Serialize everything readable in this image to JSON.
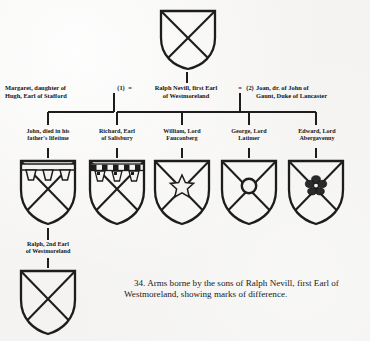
{
  "figure": {
    "number": "34.",
    "caption": "34. Arms borne by the sons of Ralph Nevill, first Earl of Westmoreland, showing marks of difference.",
    "ink_color": "#1a1a1a",
    "paper_color": "#f4f3f1"
  },
  "root": {
    "shield_name": "nevill-saltire-plain",
    "blazon_note": "saltire"
  },
  "marriage": {
    "wife_first": "Margaret, daughter of\nHugh, Earl of Stafford",
    "first_marker": "(1)",
    "equals_left": "=",
    "husband": "Ralph Nevill, first Earl\nof Westmoreland",
    "equals_right": "=",
    "second_marker": "(2)",
    "wife_second": "Joan, dr. of John of\nGaunt, Duke of Lancaster"
  },
  "sons": [
    {
      "label": "John, died in his\nfather's lifetime",
      "shield_name": "saltire-with-plain-label",
      "mark": "label"
    },
    {
      "label": "Richard, Earl\nof Salisbury",
      "shield_name": "saltire-with-compony-label",
      "mark": "label-compony"
    },
    {
      "label": "William, Lord\nFauconberg",
      "shield_name": "saltire-with-mullet",
      "mark": "mullet"
    },
    {
      "label": "George, Lord\nLatimer",
      "shield_name": "saltire-with-annulet",
      "mark": "annulet"
    },
    {
      "label": "Edward, Lord\nAbergavenny",
      "shield_name": "saltire-with-rose",
      "mark": "rose"
    }
  ],
  "grandson": {
    "label": "Ralph, 2nd Earl\nof Westmoreland",
    "shield_name": "nevill-saltire-plain"
  }
}
